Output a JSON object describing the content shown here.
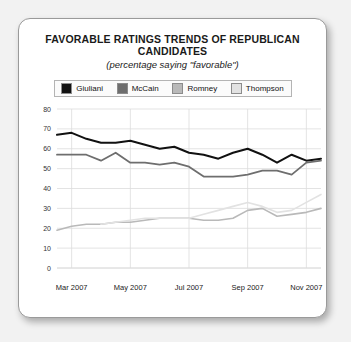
{
  "card": {
    "title": "FAVORABLE RATINGS TRENDS OF REPUBLICAN CANDIDATES",
    "subtitle": "(percentage saying \"favorable\")"
  },
  "legend": {
    "items": [
      {
        "label": "Giuliani",
        "color": "#111111"
      },
      {
        "label": "McCain",
        "color": "#6e6e6e"
      },
      {
        "label": "Romney",
        "color": "#b9b9b9"
      },
      {
        "label": "Thompson",
        "color": "#e2e2e2"
      }
    ]
  },
  "chart_data": {
    "type": "line",
    "title": "FAVORABLE RATINGS TRENDS OF REPUBLICAN CANDIDATES",
    "subtitle": "(percentage saying \"favorable\")",
    "xlabel": "",
    "ylabel": "",
    "ylim": [
      0,
      80
    ],
    "yticks": [
      0,
      10,
      20,
      30,
      40,
      50,
      60,
      70,
      80
    ],
    "xticks": [
      "Mar 2007",
      "May 2007",
      "Jul 2007",
      "Sep 2007",
      "Nov 2007"
    ],
    "xtick_positions": [
      1,
      5,
      9,
      13,
      17
    ],
    "grid": true,
    "legend_position": "top",
    "x": [
      0,
      1,
      2,
      3,
      4,
      5,
      6,
      7,
      8,
      9,
      10,
      11,
      12,
      13,
      14,
      15,
      16,
      17,
      18
    ],
    "series": [
      {
        "name": "Giuliani",
        "color": "#111111",
        "values": [
          67,
          68,
          65,
          63,
          63,
          64,
          62,
          60,
          61,
          58,
          57,
          55,
          58,
          60,
          57,
          53,
          57,
          54,
          55
        ]
      },
      {
        "name": "McCain",
        "color": "#6e6e6e",
        "values": [
          57,
          57,
          57,
          54,
          58,
          53,
          53,
          52,
          53,
          51,
          46,
          46,
          46,
          47,
          49,
          49,
          47,
          53,
          54
        ]
      },
      {
        "name": "Romney",
        "color": "#b9b9b9",
        "values": [
          19,
          21,
          22,
          22,
          23,
          23,
          24,
          25,
          25,
          25,
          24,
          24,
          25,
          29,
          30,
          26,
          27,
          28,
          30
        ]
      },
      {
        "name": "Thompson",
        "color": "#e2e2e2",
        "values": [
          null,
          null,
          null,
          22,
          23,
          24,
          25,
          25,
          25,
          25,
          27,
          29,
          31,
          33,
          31,
          28,
          29,
          33,
          37
        ]
      }
    ]
  }
}
